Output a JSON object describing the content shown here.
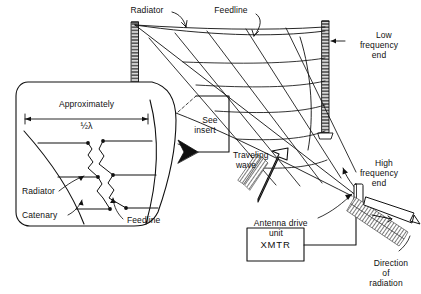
{
  "figure": {
    "background_color": "#ffffff",
    "line_color": "#101010"
  },
  "labels": {
    "radiator_top": "Radiator",
    "feedline_top": "Feedline",
    "low_frequency_end": "Low\nfrequency\nend",
    "high_frequency_end": "High\nfrequency\nend",
    "see_insert": "See\ninsert",
    "traveling_wave": "Traveling\nwave",
    "antenna_drive_unit": "Antenna drive\nunit",
    "transmitter": "XMTR",
    "direction_of_radiation": "Direction\nof\nradiation"
  },
  "insert": {
    "dimension_title": "Approximately",
    "dimension_value": "½λ",
    "radiator_label": "Radiator",
    "catenary_label": "Catenary",
    "feedline_label": "Feedline"
  }
}
